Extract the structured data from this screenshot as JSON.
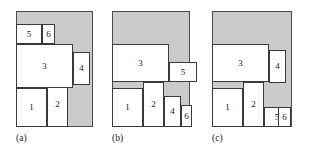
{
  "figure": {
    "kind": "packing-diagram",
    "background_color": "#ffffff",
    "bin_fill_color": "#cbcbcb",
    "rect_fill_color": "#ffffff",
    "line_color": "#3a3a3a",
    "canvas": {
      "width": 309,
      "height": 156
    }
  },
  "panels": [
    {
      "id": "a",
      "caption": "(a)",
      "caption_pos": {
        "x": 16,
        "y": 133
      },
      "bin": {
        "x": 16,
        "y": 11,
        "w": 77,
        "h": 116
      },
      "items": [
        {
          "label": "1",
          "x": 16,
          "y": 88,
          "w": 31,
          "h": 39
        },
        {
          "label": "2",
          "x": 47,
          "y": 82,
          "w": 21,
          "h": 45
        },
        {
          "label": "3",
          "x": 16,
          "y": 44,
          "w": 57,
          "h": 44
        },
        {
          "label": "4",
          "x": 73,
          "y": 52,
          "w": 17,
          "h": 33
        },
        {
          "label": "5",
          "x": 16,
          "y": 24,
          "w": 26,
          "h": 20
        },
        {
          "label": "6",
          "x": 42,
          "y": 24,
          "w": 13,
          "h": 20
        }
      ]
    },
    {
      "id": "b",
      "caption": "(b)",
      "caption_pos": {
        "x": 112,
        "y": 133
      },
      "bin": {
        "x": 112,
        "y": 11,
        "w": 78,
        "h": 116
      },
      "items": [
        {
          "label": "1",
          "x": 112,
          "y": 88,
          "w": 31,
          "h": 39
        },
        {
          "label": "2",
          "x": 143,
          "y": 82,
          "w": 21,
          "h": 45
        },
        {
          "label": "3",
          "x": 112,
          "y": 44,
          "w": 57,
          "h": 38
        },
        {
          "label": "4",
          "x": 164,
          "y": 96,
          "w": 17,
          "h": 31
        },
        {
          "label": "5",
          "x": 169,
          "y": 62,
          "w": 28,
          "h": 20
        },
        {
          "label": "6",
          "x": 181,
          "y": 105,
          "w": 11,
          "h": 22
        }
      ]
    },
    {
      "id": "c",
      "caption": "(c)",
      "caption_pos": {
        "x": 212,
        "y": 133
      },
      "bin": {
        "x": 212,
        "y": 11,
        "w": 80,
        "h": 116
      },
      "items": [
        {
          "label": "1",
          "x": 212,
          "y": 88,
          "w": 31,
          "h": 39
        },
        {
          "label": "2",
          "x": 243,
          "y": 82,
          "w": 21,
          "h": 45
        },
        {
          "label": "3",
          "x": 212,
          "y": 44,
          "w": 57,
          "h": 38
        },
        {
          "label": "4",
          "x": 269,
          "y": 50,
          "w": 17,
          "h": 33
        },
        {
          "label": "5",
          "x": 264,
          "y": 107,
          "w": 26,
          "h": 20
        },
        {
          "label": "6",
          "x": 278,
          "y": 107,
          "w": 13,
          "h": 20
        }
      ]
    }
  ]
}
